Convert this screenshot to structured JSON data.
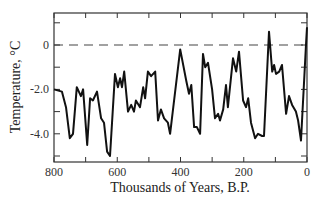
{
  "chart_data": {
    "type": "line",
    "title": "",
    "xlabel": "Thousands of Years, B.P.",
    "ylabel": "Temperature, °C",
    "xlim": [
      800,
      0
    ],
    "ylim": [
      -5.3,
      1.4
    ],
    "x_reversed": true,
    "grid": false,
    "legend": null,
    "x_ticks": [
      800,
      700,
      600,
      500,
      400,
      300,
      200,
      100,
      0
    ],
    "x_tick_labels": [
      "800",
      "600",
      "400",
      "200",
      "0"
    ],
    "x_tick_label_values": [
      800,
      600,
      400,
      200,
      0
    ],
    "y_ticks": [
      1.0,
      0,
      -1.0,
      -2.0,
      -3.0,
      -4.0,
      -5.0
    ],
    "y_tick_labels": [
      "0",
      "-2.0",
      "-4.0"
    ],
    "y_tick_label_values": [
      0,
      -2.0,
      -4.0
    ],
    "reference_line": {
      "y": 0,
      "style": "dashed"
    },
    "series": [
      {
        "name": "Temperature",
        "x": [
          800,
          775,
          762,
          750,
          740,
          728,
          715,
          708,
          695,
          686,
          677,
          664,
          651,
          642,
          632,
          623,
          607,
          598,
          591,
          585,
          578,
          566,
          556,
          547,
          541,
          528,
          518,
          512,
          503,
          493,
          480,
          471,
          462,
          452,
          440,
          433,
          401,
          382,
          373,
          366,
          357,
          348,
          338,
          329,
          322,
          313,
          300,
          291,
          281,
          275,
          265,
          256,
          250,
          234,
          224,
          215,
          202,
          193,
          186,
          177,
          164,
          155,
          142,
          136,
          120,
          110,
          104,
          98,
          88,
          79,
          66,
          57,
          47,
          35,
          28,
          19,
          3,
          0
        ],
        "values": [
          -2.0,
          -2.1,
          -2.8,
          -4.2,
          -4.0,
          -1.9,
          -2.3,
          -2.0,
          -4.5,
          -2.4,
          -2.5,
          -2.1,
          -3.3,
          -3.5,
          -4.8,
          -5.0,
          -1.3,
          -1.9,
          -1.5,
          -1.9,
          -1.2,
          -3.0,
          -2.7,
          -3.0,
          -2.5,
          -2.8,
          -1.9,
          -2.4,
          -1.2,
          -1.4,
          -1.2,
          -3.4,
          -2.9,
          -3.3,
          -3.5,
          -4.0,
          -0.2,
          -1.6,
          -2.2,
          -1.8,
          -3.7,
          -3.7,
          -4.0,
          -0.4,
          -1.0,
          -0.8,
          -2.0,
          -3.3,
          -3.1,
          -3.4,
          -2.9,
          -1.8,
          -2.8,
          -0.6,
          -1.2,
          -0.3,
          -2.5,
          -2.8,
          -2.4,
          -3.5,
          -4.2,
          -4.0,
          -4.1,
          -4.1,
          0.6,
          -1.2,
          -0.9,
          -1.3,
          -1.2,
          -0.9,
          -3.1,
          -2.3,
          -2.7,
          -3.0,
          -3.4,
          -4.3,
          0.1,
          0.8
        ]
      }
    ]
  }
}
